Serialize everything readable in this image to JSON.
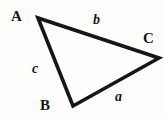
{
  "figure": {
    "kind": "geometry-diagram",
    "background_color": "#fdfdfb",
    "stroke_color": "#161616",
    "stroke_width_px": 3.6
  },
  "triangle": {
    "vertices": [
      {
        "name": "A",
        "label": "A",
        "x": 38,
        "y": 18
      },
      {
        "name": "B",
        "label": "B",
        "x": 73,
        "y": 106
      },
      {
        "name": "C",
        "label": "C",
        "x": 159,
        "y": 58
      }
    ],
    "sides": [
      {
        "name": "a",
        "label": "a",
        "between": "B-C"
      },
      {
        "name": "b",
        "label": "b",
        "between": "A-C"
      },
      {
        "name": "c",
        "label": "c",
        "between": "A-B"
      }
    ],
    "path": "M 38 18 L 159 58 L 73 106 Z"
  },
  "labels": {
    "vertex_A": "A",
    "vertex_B": "B",
    "vertex_C": "C",
    "side_a": "a",
    "side_b": "b",
    "side_c": "c"
  }
}
